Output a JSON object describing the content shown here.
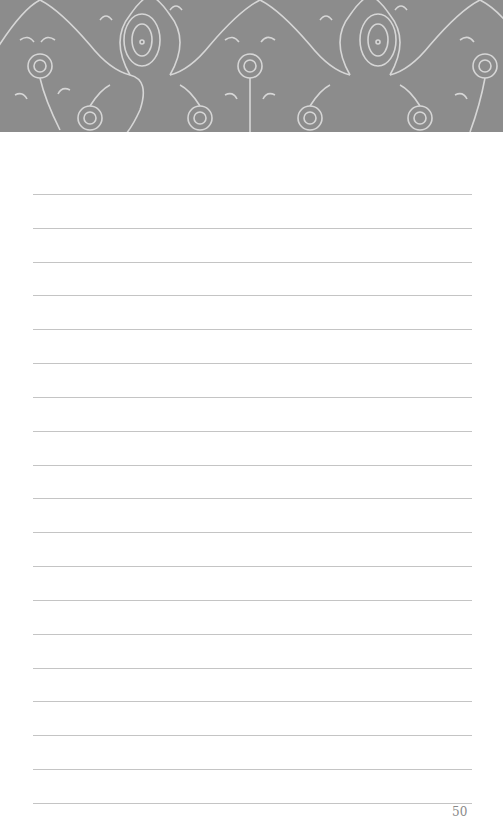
{
  "page": {
    "banner": {
      "pattern": "ornamental-floral-pattern",
      "color": "#8c8c8c",
      "line_color": "#d9d9d9"
    },
    "ruled_lines": {
      "count": 19,
      "first_y": 194,
      "spacing": 33.8,
      "color": "#c4c4c4"
    },
    "page_number": "50"
  }
}
